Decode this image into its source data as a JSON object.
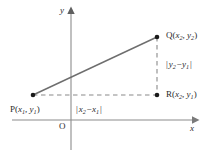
{
  "figure": {
    "name": "distance-formula-diagram",
    "type": "coordinate-geometry",
    "background_color": "#ffffff",
    "axis_color": "#8c8c8c",
    "line_color": "#6e6e6e",
    "dash_color": "#8a8a8a",
    "text_color": "#2b2b2b",
    "point_color": "#1a1a1a"
  },
  "axes": {
    "x_label": "x",
    "y_label": "y",
    "origin_label": "O",
    "x_axis": {
      "x1": 12,
      "x2": 196,
      "y": 120
    },
    "y_axis": {
      "y1": 10,
      "y2": 150,
      "x": 71
    }
  },
  "points": [
    {
      "id": "P",
      "name": "point-p",
      "label_prefix": "P",
      "coord_x": "x",
      "coord_x_sub": "1",
      "coord_y": "y",
      "coord_y_sub": "1",
      "cx": 33,
      "cy": 95
    },
    {
      "id": "Q",
      "name": "point-q",
      "label_prefix": "Q",
      "coord_x": "x",
      "coord_x_sub": "2",
      "coord_y": "y",
      "coord_y_sub": "2",
      "cx": 157,
      "cy": 37
    },
    {
      "id": "R",
      "name": "point-r",
      "label_prefix": "R",
      "coord_x": "x",
      "coord_x_sub": "2",
      "coord_y": "y",
      "coord_y_sub": "1",
      "cx": 157,
      "cy": 95
    }
  ],
  "segments": {
    "hypotenuse": {
      "name": "segment-pq",
      "style": "solid",
      "from": "P",
      "to": "Q"
    },
    "horizontal_leg": {
      "name": "segment-pr",
      "style": "dashed",
      "from": "P",
      "to": "R"
    },
    "vertical_leg": {
      "name": "segment-qr",
      "style": "dashed",
      "from": "Q",
      "to": "R"
    }
  },
  "measure_labels": {
    "vertical": {
      "name": "label-delta-y",
      "var": "y",
      "sub_a": "2",
      "sub_b": "1",
      "operator": "−",
      "bar": "|"
    },
    "horizontal": {
      "name": "label-delta-x",
      "var": "x",
      "sub_a": "2",
      "sub_b": "1",
      "operator": "−",
      "bar": "|"
    }
  }
}
